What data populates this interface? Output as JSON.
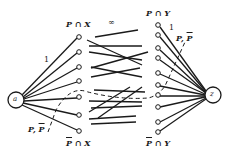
{
  "diagram": {
    "source_node": {
      "label": "a"
    },
    "sink_node": {
      "label": "z"
    },
    "labels": {
      "top_left": "P ∩ X",
      "bottom_left_P": "P",
      "bottom_left_rest": " ∩ X",
      "top_right": "P ∩ Y",
      "bottom_right_P": "P",
      "bottom_right_rest": " ∩ Y",
      "infinity": "∞",
      "left_capacity": "1",
      "right_capacity": "1",
      "cut_left_P": "P, ",
      "cut_left_Pbar": "P",
      "cut_right_P": "P, ",
      "cut_right_Pbar": "P"
    },
    "colors": {
      "line": "#1a1a1a",
      "background": "#ffffff"
    }
  }
}
